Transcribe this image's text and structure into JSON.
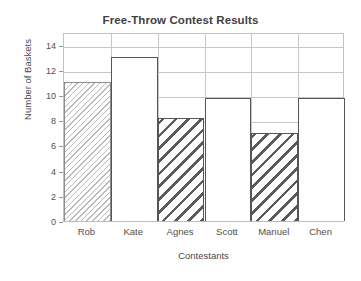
{
  "chart_data": {
    "type": "bar",
    "title": "Free-Throw Contest Results",
    "xlabel": "Contestants",
    "ylabel": "Number of Baskets",
    "categories": [
      "Rob",
      "Kate",
      "Agnes",
      "Scott",
      "Manuel",
      "Chen"
    ],
    "values": [
      11,
      13,
      8.2,
      9.8,
      7,
      9.8
    ],
    "series": [
      {
        "name": "Number of Baskets",
        "values": [
          11,
          13,
          8.2,
          9.8,
          7,
          9.8
        ]
      }
    ],
    "bar_styles": [
      "fine-hatch",
      "open",
      "coarse-hatch",
      "open",
      "coarse-hatch",
      "open"
    ],
    "ylim": [
      0,
      15
    ],
    "xlim_categories": 6,
    "yticks": [
      0,
      2,
      4,
      6,
      8,
      10,
      12,
      14
    ],
    "ytick_labels": [
      "0",
      "2",
      "4",
      "6",
      "8",
      "10",
      "12",
      "14"
    ],
    "grid": true,
    "grid_axis": "both",
    "legend": false,
    "legend_position": "none",
    "colors": {
      "grid": "#c7c7c7",
      "axis": "#c2c2c2",
      "bar_edge_dark": "#555555",
      "bar_edge_light": "#8d8d8d",
      "hatch_light": "#b9b9b9",
      "hatch_dark": "#5a5a5a",
      "text": "#4a4a4a",
      "title": "#3f3f3f",
      "background": "#ffffff"
    }
  }
}
